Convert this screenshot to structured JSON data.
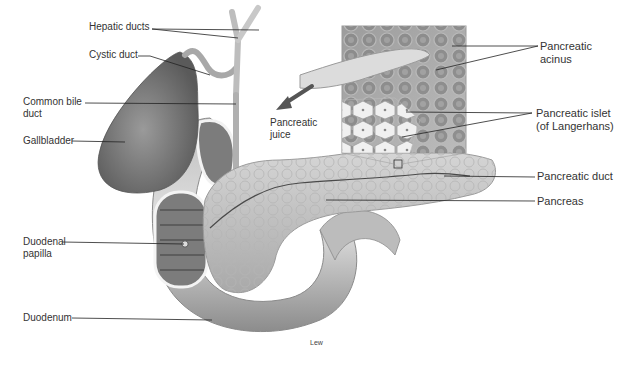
{
  "figure": {
    "credit": "Lew",
    "colors": {
      "organ_dark": "#6e6e6e",
      "organ_mid": "#a4a4a4",
      "organ_light": "#d6d6d6",
      "pancreas": "#c9c9c9",
      "leader_line": "#222222",
      "label_text": "#333333"
    }
  },
  "labels": {
    "hepatic_ducts": "Hepatic ducts",
    "cystic_duct": "Cystic duct",
    "common_bile_duct_line1": "Common bile",
    "common_bile_duct_line2": "duct",
    "gallbladder": "Gallbladder",
    "duodenal_papilla_line1": "Duodenal",
    "duodenal_papilla_line2": "papilla",
    "duodenum": "Duodenum",
    "pancreatic_juice_line1": "Pancreatic",
    "pancreatic_juice_line2": "juice",
    "pancreatic_acinus_line1": "Pancreatic",
    "pancreatic_acinus_line2": "acinus",
    "pancreatic_islet_line1": "Pancreatic islet",
    "pancreatic_islet_line2": "(of Langerhans)",
    "pancreatic_duct": "Pancreatic duct",
    "pancreas": "Pancreas"
  }
}
